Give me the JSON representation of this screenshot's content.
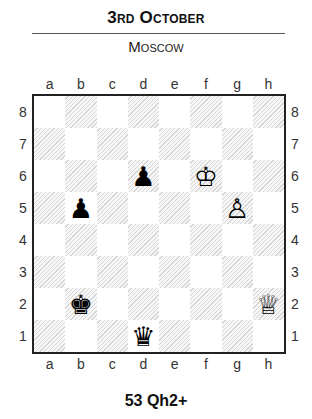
{
  "header": {
    "title": "3rd October",
    "subtitle": "Moscow"
  },
  "board": {
    "files": [
      "a",
      "b",
      "c",
      "d",
      "e",
      "f",
      "g",
      "h"
    ],
    "ranks": [
      "8",
      "7",
      "6",
      "5",
      "4",
      "3",
      "2",
      "1"
    ],
    "light_square_color": "#ffffff",
    "dark_square_style": "diagonal-hatch",
    "pieces": [
      {
        "square": "d6",
        "color": "black",
        "type": "pawn",
        "glyph": "♟"
      },
      {
        "square": "f6",
        "color": "white",
        "type": "king",
        "glyph": "♔"
      },
      {
        "square": "b5",
        "color": "black",
        "type": "pawn",
        "glyph": "♟"
      },
      {
        "square": "g5",
        "color": "white",
        "type": "pawn",
        "glyph": "♙"
      },
      {
        "square": "b2",
        "color": "black",
        "type": "king",
        "glyph": "♚"
      },
      {
        "square": "h2",
        "color": "white",
        "type": "queen",
        "glyph": "♕"
      },
      {
        "square": "d1",
        "color": "black",
        "type": "queen",
        "glyph": "♛"
      }
    ]
  },
  "caption": {
    "move": "53 Qh2+"
  }
}
